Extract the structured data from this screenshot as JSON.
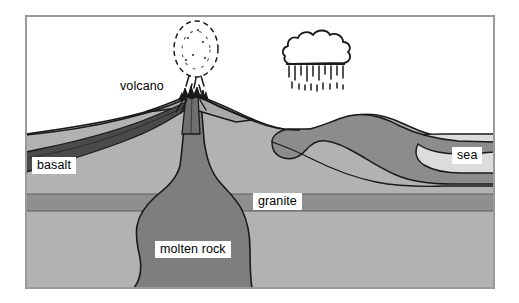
{
  "diagram": {
    "frame": {
      "border_color": "#9a9a9a",
      "background": "#ffffff"
    },
    "labels": [
      {
        "id": "volcano",
        "text": "volcano",
        "boxed": false
      },
      {
        "id": "basalt",
        "text": "basalt",
        "boxed": true
      },
      {
        "id": "granite",
        "text": "granite",
        "boxed": true
      },
      {
        "id": "sea",
        "text": "sea",
        "boxed": true
      },
      {
        "id": "molten_rock",
        "text": "molten rock",
        "boxed": true
      }
    ],
    "colors": {
      "sky": "#ffffff",
      "bedrock": "#b2b2b2",
      "granite_band": "#8f8f8f",
      "basalt_flow": "#4a4a4a",
      "molten_rock": "#7e7e7e",
      "sediment": "#8c8c8c",
      "sea_water": "#dcdcdc",
      "outline": "#1a1a1a"
    },
    "features": {
      "volcano": {
        "summit_label": "volcano",
        "has_ash_plume": true,
        "plume_style": "dotted-dashed-oval",
        "has_conduit": true
      },
      "rain_cloud": {
        "style": "scalloped-outline",
        "has_rain": true,
        "rain_style": "vertical-dashes"
      },
      "layers": [
        {
          "name": "basalt",
          "description": "dark lava flow wedge to the left of the volcano"
        },
        {
          "name": "granite",
          "description": "horizontal darker band across mid-depth"
        },
        {
          "name": "molten rock",
          "description": "magma body rising beneath the volcano"
        },
        {
          "name": "sediment",
          "description": "folded layer dipping right into the sea"
        },
        {
          "name": "sea",
          "description": "light water body on the right side"
        }
      ]
    }
  }
}
